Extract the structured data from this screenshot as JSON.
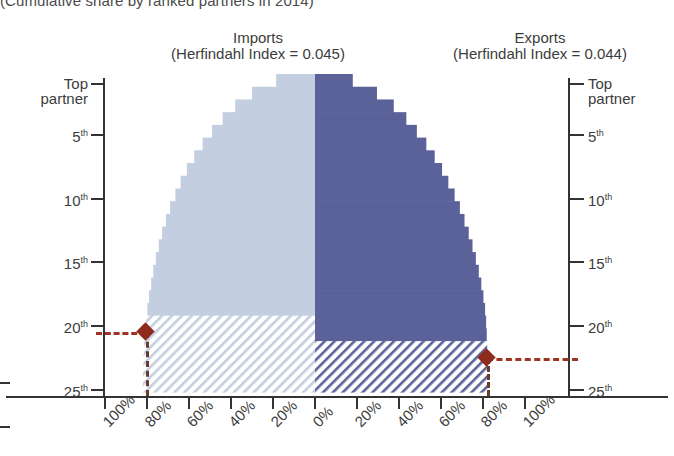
{
  "subtitle": "(Cumulative share by ranked partners in 2014)",
  "panels": {
    "imports": {
      "title": "Imports",
      "index_label": "(Herfindahl Index = 0.045)",
      "color": "#c3cee0",
      "hatch_color": "#b9c6dc",
      "herfindahl_index": 0.045,
      "marker_rank": "20th",
      "marker_share": "80%"
    },
    "exports": {
      "title": "Exports",
      "index_label": "(Herfindahl Index = 0.044)",
      "color": "#5b6199",
      "hatch_color": "#6a6fa3",
      "herfindahl_index": 0.044,
      "marker_rank": "22nd",
      "marker_share": "80%"
    }
  },
  "axes": {
    "y_left_title_lines": [
      "Top",
      "partner"
    ],
    "y_right_title_lines": [
      "Top",
      "partner"
    ],
    "y_ticks": [
      {
        "label": "Top partner",
        "value": 1
      },
      {
        "label": "5",
        "suffix": "th",
        "value": 5
      },
      {
        "label": "10",
        "suffix": "th",
        "value": 10
      },
      {
        "label": "15",
        "suffix": "th",
        "value": 15
      },
      {
        "label": "20",
        "suffix": "th",
        "value": 20
      },
      {
        "label": "25",
        "suffix": "th",
        "value": 25
      }
    ],
    "x_ticks": [
      "100%",
      "80%",
      "60%",
      "40%",
      "20%",
      "0%",
      "20%",
      "40%",
      "60%",
      "80%",
      "100%"
    ]
  },
  "colors": {
    "imports_fill": "#c3cee0",
    "exports_fill": "#5b6199",
    "marker": "#8e2b1d",
    "axis": "#333333",
    "text": "#3c3c3c"
  },
  "chart_data": {
    "type": "bar",
    "subtitle": "(Cumulative share by ranked partners in 2014)",
    "xlabel": "",
    "ylabel": "Partner rank",
    "orientation": "horizontal-mirrored",
    "xlim": [
      100,
      0,
      100
    ],
    "ylim": [
      1,
      25
    ],
    "grid": false,
    "legend": "none",
    "categories": [
      "Top partner",
      "2nd",
      "3rd",
      "4th",
      "5th",
      "6th",
      "7th",
      "8th",
      "9th",
      "10th",
      "11th",
      "12th",
      "13th",
      "14th",
      "15th",
      "16th",
      "17th",
      "18th",
      "19th",
      "20th",
      "21st",
      "22nd",
      "23rd",
      "24th",
      "25th"
    ],
    "series": [
      {
        "name": "Imports",
        "side": "left",
        "unit": "% cumulative share",
        "values": [
          18.5,
          30.0,
          38.0,
          44.0,
          49.0,
          53.5,
          57.5,
          61.0,
          64.0,
          66.5,
          69.0,
          71.0,
          72.8,
          74.4,
          75.8,
          77.0,
          78.0,
          79.0,
          79.8,
          80.5,
          81.0,
          81.4,
          81.7,
          81.9,
          82.0
        ]
      },
      {
        "name": "Exports",
        "side": "right",
        "unit": "% cumulative share",
        "values": [
          18.0,
          29.5,
          37.5,
          43.5,
          48.5,
          53.0,
          57.0,
          60.5,
          63.5,
          66.5,
          69.0,
          71.2,
          73.2,
          75.0,
          76.6,
          78.0,
          79.2,
          80.2,
          81.0,
          81.5,
          81.8,
          82.0,
          82.1,
          82.2,
          82.2
        ]
      }
    ],
    "annotations": [
      {
        "name": "imports-marker",
        "label": "20th / 80%",
        "rank": 20,
        "share": 80.5,
        "side": "left"
      },
      {
        "name": "exports-marker",
        "label": "22nd / 80%",
        "rank": 22,
        "share": 81.8,
        "side": "right"
      }
    ]
  }
}
